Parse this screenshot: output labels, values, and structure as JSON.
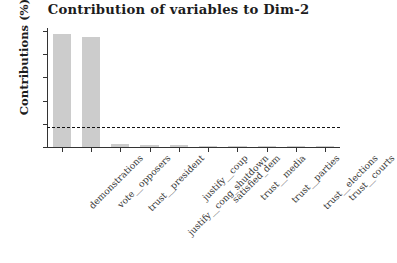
{
  "chart_data": {
    "type": "bar",
    "title": "Contribution of variables to Dim-2",
    "xlabel": "",
    "ylabel": "Contributions (%)",
    "ylim": [
      0,
      50
    ],
    "yticks": [
      0,
      10,
      20,
      30,
      40,
      50
    ],
    "ytick_labels": [
      "0",
      "10",
      "20",
      "30",
      "40",
      "50"
    ],
    "grid": false,
    "legend": "none",
    "bar_color": "#cccccc",
    "bar_edge_color": "#cccccc",
    "categories": [
      "demonstrations",
      "vote__opposers",
      "trust__president",
      "justify__cong_shutdown",
      "justify__coup",
      "satisfied_dem",
      "trust__media",
      "trust__parties",
      "trust__elections",
      "trust__courts"
    ],
    "values": [
      48.5,
      47.3,
      1.3,
      0.9,
      0.7,
      0.6,
      0.5,
      0.45,
      0.4,
      0.35
    ],
    "reference_line": {
      "value": 8.5,
      "style": "dashed",
      "color": "#111111",
      "label": "expected average contribution"
    }
  },
  "figure": {
    "background_color": "#ffffff",
    "axis_color": "#333333",
    "text_color": "#1c1c1c"
  }
}
